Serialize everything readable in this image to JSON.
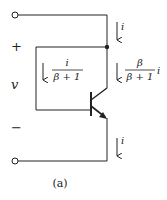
{
  "figure": {
    "caption": "(a)",
    "terminal_labels": {
      "plus": "+",
      "voltage": "v",
      "minus": "−"
    },
    "currents": {
      "top": {
        "symbol": "i",
        "direction": "down"
      },
      "base": {
        "numerator": "i",
        "denominator": "β + 1",
        "direction": "down"
      },
      "collector": {
        "numerator": "β",
        "denominator": "β + 1",
        "suffix": "i",
        "direction": "down"
      },
      "bottom": {
        "symbol": "i",
        "direction": "down"
      }
    },
    "components": {
      "transistor": "npn-bjt",
      "terminals": [
        "top-terminal",
        "bottom-terminal"
      ],
      "junction_node": "collector-base-node"
    },
    "colors": {
      "wire": "#222222",
      "background": "#ffffff"
    }
  }
}
